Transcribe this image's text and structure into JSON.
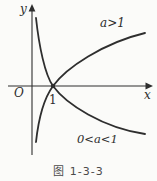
{
  "figure": {
    "caption": "图 1-3-3",
    "axes": {
      "y_label": "y",
      "x_label": "x",
      "origin_label": "O",
      "x_tick_label": "1"
    },
    "curves": {
      "increasing_label": "a>1",
      "decreasing_label": "0<a<1"
    },
    "colors": {
      "ink": "#2e2e2e",
      "background": "#fbfbf9"
    }
  }
}
